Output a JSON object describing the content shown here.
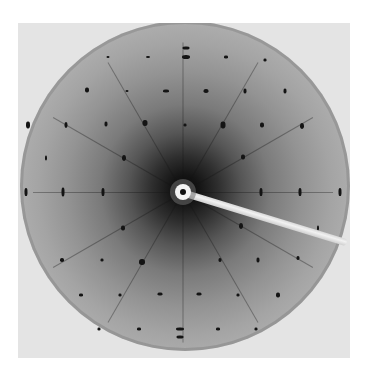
{
  "image": {
    "subject": "X-ray diffraction pattern",
    "frame": {
      "x": 18,
      "y": 23,
      "width": 332,
      "height": 335
    },
    "center": {
      "x": 183,
      "y": 192
    },
    "beamstop": {
      "shape": "circle-with-arm",
      "arm_angle_deg": 17
    }
  },
  "spots": [
    {
      "x": 186,
      "y": 48,
      "w": 7,
      "h": 3
    },
    {
      "x": 186,
      "y": 57,
      "w": 8,
      "h": 4
    },
    {
      "x": 166,
      "y": 91,
      "w": 6,
      "h": 3
    },
    {
      "x": 206,
      "y": 91,
      "w": 5,
      "h": 4
    },
    {
      "x": 185,
      "y": 125,
      "w": 3,
      "h": 3
    },
    {
      "x": 148,
      "y": 57,
      "w": 4,
      "h": 2
    },
    {
      "x": 108,
      "y": 57,
      "w": 3,
      "h": 2
    },
    {
      "x": 226,
      "y": 57,
      "w": 4,
      "h": 3
    },
    {
      "x": 265,
      "y": 60,
      "w": 3,
      "h": 3
    },
    {
      "x": 87,
      "y": 90,
      "w": 4,
      "h": 5
    },
    {
      "x": 127,
      "y": 91,
      "w": 3,
      "h": 2
    },
    {
      "x": 245,
      "y": 91,
      "w": 3,
      "h": 5
    },
    {
      "x": 285,
      "y": 91,
      "w": 3,
      "h": 5
    },
    {
      "x": 28,
      "y": 125,
      "w": 4,
      "h": 7
    },
    {
      "x": 66,
      "y": 125,
      "w": 3,
      "h": 6
    },
    {
      "x": 106,
      "y": 124,
      "w": 3,
      "h": 5
    },
    {
      "x": 145,
      "y": 123,
      "w": 5,
      "h": 6
    },
    {
      "x": 223,
      "y": 125,
      "w": 5,
      "h": 7
    },
    {
      "x": 262,
      "y": 125,
      "w": 4,
      "h": 5
    },
    {
      "x": 302,
      "y": 126,
      "w": 4,
      "h": 6
    },
    {
      "x": 46,
      "y": 158,
      "w": 2,
      "h": 5
    },
    {
      "x": 124,
      "y": 158,
      "w": 4,
      "h": 6
    },
    {
      "x": 243,
      "y": 157,
      "w": 4,
      "h": 5
    },
    {
      "x": 26,
      "y": 192,
      "w": 3,
      "h": 8
    },
    {
      "x": 63,
      "y": 192,
      "w": 3,
      "h": 9
    },
    {
      "x": 103,
      "y": 192,
      "w": 3,
      "h": 8
    },
    {
      "x": 261,
      "y": 192,
      "w": 3,
      "h": 8
    },
    {
      "x": 300,
      "y": 192,
      "w": 3,
      "h": 8
    },
    {
      "x": 340,
      "y": 192,
      "w": 3,
      "h": 8
    },
    {
      "x": 123,
      "y": 228,
      "w": 4,
      "h": 5
    },
    {
      "x": 241,
      "y": 226,
      "w": 4,
      "h": 6
    },
    {
      "x": 318,
      "y": 228,
      "w": 2,
      "h": 5
    },
    {
      "x": 62,
      "y": 260,
      "w": 4,
      "h": 4
    },
    {
      "x": 102,
      "y": 260,
      "w": 3,
      "h": 3
    },
    {
      "x": 142,
      "y": 262,
      "w": 6,
      "h": 6
    },
    {
      "x": 220,
      "y": 260,
      "w": 3,
      "h": 4
    },
    {
      "x": 258,
      "y": 260,
      "w": 3,
      "h": 5
    },
    {
      "x": 298,
      "y": 258,
      "w": 3,
      "h": 4
    },
    {
      "x": 81,
      "y": 295,
      "w": 4,
      "h": 3
    },
    {
      "x": 120,
      "y": 295,
      "w": 3,
      "h": 3
    },
    {
      "x": 160,
      "y": 294,
      "w": 5,
      "h": 3
    },
    {
      "x": 199,
      "y": 294,
      "w": 5,
      "h": 3
    },
    {
      "x": 238,
      "y": 295,
      "w": 3,
      "h": 3
    },
    {
      "x": 278,
      "y": 295,
      "w": 4,
      "h": 5
    },
    {
      "x": 99,
      "y": 329,
      "w": 3,
      "h": 3
    },
    {
      "x": 139,
      "y": 329,
      "w": 4,
      "h": 3
    },
    {
      "x": 180,
      "y": 329,
      "w": 8,
      "h": 3
    },
    {
      "x": 180,
      "y": 337,
      "w": 7,
      "h": 3
    },
    {
      "x": 218,
      "y": 329,
      "w": 4,
      "h": 3
    },
    {
      "x": 256,
      "y": 329,
      "w": 3,
      "h": 3
    }
  ],
  "streaks": [
    {
      "angle": 0
    },
    {
      "angle": 90
    },
    {
      "angle": 180
    },
    {
      "angle": 270
    },
    {
      "angle": 30
    },
    {
      "angle": 60
    },
    {
      "angle": 120
    },
    {
      "angle": 150
    },
    {
      "angle": 210
    },
    {
      "angle": 240
    },
    {
      "angle": 300
    },
    {
      "angle": 330
    }
  ]
}
